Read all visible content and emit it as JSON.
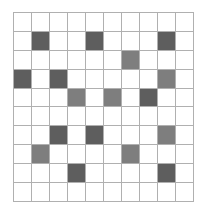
{
  "grid": {
    "rows": 10,
    "cols": 10,
    "colors": {
      "empty": "#ffffff",
      "dark": "#5e5e5e",
      "medium": "#7e7e7e",
      "line": "#b0b0b0"
    },
    "cells": [
      [
        "empty",
        "empty",
        "empty",
        "empty",
        "empty",
        "empty",
        "empty",
        "empty",
        "empty",
        "empty"
      ],
      [
        "empty",
        "dark",
        "empty",
        "empty",
        "dark",
        "empty",
        "empty",
        "empty",
        "dark",
        "empty"
      ],
      [
        "empty",
        "empty",
        "empty",
        "empty",
        "empty",
        "empty",
        "medium",
        "empty",
        "empty",
        "empty"
      ],
      [
        "dark",
        "empty",
        "dark",
        "empty",
        "empty",
        "empty",
        "empty",
        "empty",
        "medium",
        "empty"
      ],
      [
        "empty",
        "empty",
        "empty",
        "medium",
        "empty",
        "medium",
        "empty",
        "dark",
        "empty",
        "empty"
      ],
      [
        "empty",
        "empty",
        "empty",
        "empty",
        "empty",
        "empty",
        "empty",
        "empty",
        "empty",
        "empty"
      ],
      [
        "empty",
        "empty",
        "dark",
        "empty",
        "dark",
        "empty",
        "empty",
        "empty",
        "medium",
        "empty"
      ],
      [
        "empty",
        "medium",
        "empty",
        "empty",
        "empty",
        "empty",
        "medium",
        "empty",
        "empty",
        "empty"
      ],
      [
        "empty",
        "empty",
        "empty",
        "dark",
        "empty",
        "empty",
        "empty",
        "empty",
        "dark",
        "empty"
      ],
      [
        "empty",
        "empty",
        "empty",
        "empty",
        "empty",
        "empty",
        "empty",
        "empty",
        "empty",
        "empty"
      ]
    ]
  }
}
